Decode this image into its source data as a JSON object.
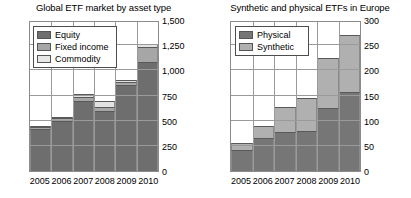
{
  "charts": [
    {
      "key": "global_etf",
      "title": "Global ETF market by asset type",
      "legend": [
        {
          "label": "Equity",
          "swatch": "s0"
        },
        {
          "label": "Fixed income",
          "swatch": "s1"
        },
        {
          "label": "Commodity",
          "swatch": "s2"
        }
      ],
      "yticks": [
        "0",
        "250",
        "500",
        "750",
        "1,000",
        "1,250",
        "1,500"
      ],
      "xticks": [
        "2005",
        "2006",
        "2007",
        "2008",
        "2009",
        "2010"
      ]
    },
    {
      "key": "synth_phys",
      "title": "Synthetic and physical ETFs in Europe",
      "legend": [
        {
          "label": "Physical",
          "swatch": "s0"
        },
        {
          "label": "Synthetic",
          "swatch": "s1"
        }
      ],
      "yticks": [
        "0",
        "50",
        "100",
        "150",
        "200",
        "250",
        "300"
      ],
      "xticks": [
        "2005",
        "2006",
        "2007",
        "2008",
        "2009",
        "2010"
      ]
    }
  ],
  "chart_data": [
    {
      "type": "bar",
      "stacked": true,
      "title": "Global ETF market by asset type",
      "xlabel": "",
      "ylabel": "",
      "ylim": [
        0,
        1500
      ],
      "yticks": [
        0,
        250,
        500,
        750,
        1000,
        1250,
        1500
      ],
      "grid": true,
      "legend_position": "top-left",
      "categories": [
        "2005",
        "2006",
        "2007",
        "2008",
        "2009",
        "2010"
      ],
      "series": [
        {
          "name": "Equity",
          "values": [
            420,
            500,
            700,
            600,
            850,
            1080
          ]
        },
        {
          "name": "Fixed income",
          "values": [
            15,
            25,
            40,
            35,
            35,
            150
          ]
        },
        {
          "name": "Commodity",
          "values": [
            10,
            15,
            25,
            60,
            20,
            30
          ]
        }
      ],
      "totals": [
        445,
        540,
        765,
        695,
        905,
        1260
      ]
    },
    {
      "type": "bar",
      "stacked": true,
      "title": "Synthetic and physical ETFs in Europe",
      "xlabel": "",
      "ylabel": "",
      "ylim": [
        0,
        300
      ],
      "yticks": [
        0,
        50,
        100,
        150,
        200,
        250,
        300
      ],
      "grid": true,
      "legend_position": "top-left",
      "categories": [
        "2005",
        "2006",
        "2007",
        "2008",
        "2009",
        "2010"
      ],
      "series": [
        {
          "name": "Physical",
          "values": [
            42,
            65,
            78,
            80,
            125,
            157
          ]
        },
        {
          "name": "Synthetic",
          "values": [
            13,
            25,
            50,
            65,
            100,
            113
          ]
        }
      ],
      "totals": [
        55,
        90,
        128,
        145,
        225,
        270
      ]
    }
  ]
}
